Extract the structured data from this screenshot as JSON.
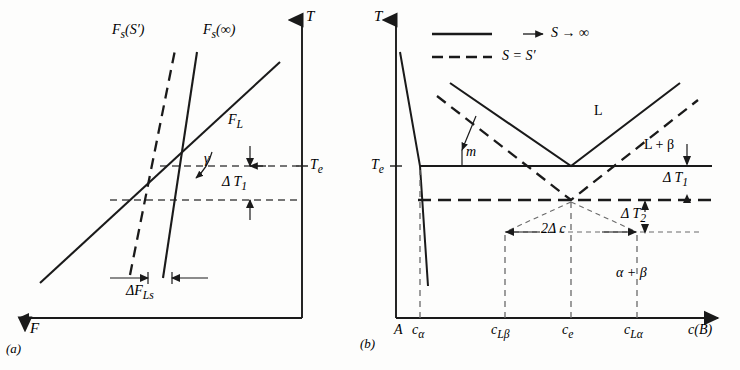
{
  "figure": {
    "kind": "two-panel-thermodynamic-diagram",
    "background": "#fdfdfc",
    "ink": "#1a1a1a",
    "panels": [
      {
        "id": "a",
        "caption": "(a)",
        "axes": {
          "y_label": "T",
          "y_axis_position": "right",
          "y_arrow": "up",
          "x_label": "F",
          "x_axis_position": "bottom",
          "x_arrow": "left"
        },
        "curve_labels": {
          "solid_steep": "Fs(∞)",
          "dashed_steep": "Fs(S′)",
          "diagonal": "FL"
        },
        "annotations": {
          "angle": "γ",
          "temperature_tick": "Te",
          "delta_T": "Δ T1",
          "delta_F": "ΔFLs"
        }
      },
      {
        "id": "b",
        "caption": "(b)",
        "axes": {
          "y_label": "T",
          "y_axis_position": "left",
          "y_arrow": "up",
          "x_label": "c(B)",
          "x_axis_position": "bottom",
          "x_arrow": "right"
        },
        "legend": [
          {
            "style": "solid",
            "label": "S → ∞"
          },
          {
            "style": "dashed",
            "label": "S = S′"
          }
        ],
        "region_labels": [
          "L",
          "L + β",
          "α + β"
        ],
        "annotations": {
          "slope": "m",
          "eutectic_temp": "Te",
          "delta_T1": "Δ T1",
          "delta_T2": "Δ T2",
          "delta_c": "2Δ c"
        },
        "x_ticks": [
          "A",
          "cα",
          "cLβ",
          "ce",
          "cLα"
        ]
      }
    ]
  },
  "chart_data": {
    "type": "line",
    "title": "",
    "subfigures": [
      {
        "id": "a",
        "xlabel": "F",
        "ylabel": "T",
        "note": "Free-energy vs temperature construction; solid-line Fs(∞) and dashed-line Fs(S′) intersect the liquid line FL at two temperatures separated by ΔT1, horizontally offset by ΔFLs.",
        "series": [
          {
            "name": "FL",
            "style": "solid",
            "points": [
              [
                0.12,
                0.2
              ],
              [
                0.78,
                0.86
              ]
            ]
          },
          {
            "name": "Fs(∞)",
            "style": "solid",
            "points": [
              [
                0.565,
                0.12
              ],
              [
                0.655,
                0.92
              ]
            ]
          },
          {
            "name": "Fs(S′)",
            "style": "dashed",
            "points": [
              [
                0.455,
                0.12
              ],
              [
                0.575,
                0.93
              ]
            ]
          }
        ],
        "guides": [
          {
            "name": "Te-line",
            "y": 0.565,
            "style": "dashed"
          },
          {
            "name": "Te-minus-dT",
            "y": 0.455,
            "style": "dashed"
          }
        ]
      },
      {
        "id": "b",
        "xlabel": "c(B)",
        "ylabel": "T",
        "note": "Eutectic phase diagram. Solid eutectic horizontal at Te with liquidus V meeting at ce; dashed (S = S′) liquidus V is depressed by ΔT2 and widened by 2Δc.",
        "x_ticks": {
          "A": 0.0,
          "cα": 0.075,
          "cLβ": 0.375,
          "ce": 0.545,
          "cLα": 0.715
        },
        "y_ticks": {
          "Te": 0.565
        },
        "series": [
          {
            "name": "liquidus-left-solid",
            "style": "solid",
            "points": [
              [
                0.175,
                0.845
              ],
              [
                0.545,
                0.565
              ]
            ]
          },
          {
            "name": "liquidus-right-solid",
            "style": "solid",
            "points": [
              [
                0.545,
                0.565
              ],
              [
                0.855,
                0.845
              ]
            ]
          },
          {
            "name": "liquidus-left-dashed",
            "style": "dashed",
            "points": [
              [
                0.135,
                0.805
              ],
              [
                0.545,
                0.455
              ]
            ]
          },
          {
            "name": "liquidus-right-dashed",
            "style": "dashed",
            "points": [
              [
                0.545,
                0.455
              ],
              [
                0.905,
                0.795
              ]
            ]
          },
          {
            "name": "solvus-alpha",
            "style": "solid",
            "points": [
              [
                0.012,
                0.935
              ],
              [
                0.075,
                0.565
              ],
              [
                0.095,
                0.215
              ]
            ]
          },
          {
            "name": "eutectic-solid",
            "style": "solid",
            "points": [
              [
                0.075,
                0.565
              ],
              [
                0.985,
                0.565
              ]
            ]
          },
          {
            "name": "eutectic-dashed",
            "style": "dashed",
            "points": [
              [
                0.075,
                0.455
              ],
              [
                0.985,
                0.455
              ]
            ]
          }
        ]
      }
    ]
  }
}
